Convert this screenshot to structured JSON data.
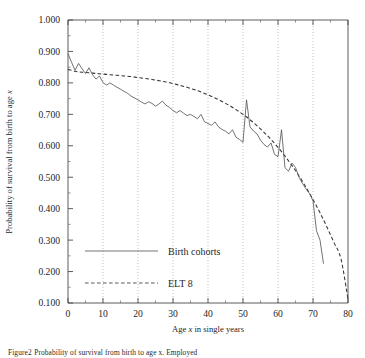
{
  "figure": {
    "caption_prefix": "Figure",
    "caption_number": "2",
    "caption_text": "Probability of survival from birth to age x. Employed"
  },
  "chart_data": {
    "type": "line",
    "title": "",
    "xlabel": "Age x in single years",
    "ylabel": "Probability of survival from birth to age x",
    "xlim": [
      0,
      80
    ],
    "ylim": [
      0.1,
      1.0
    ],
    "xticks": [
      0,
      10,
      20,
      30,
      40,
      50,
      60,
      70,
      80
    ],
    "xtick_labels": [
      "0",
      "10",
      "20",
      "30",
      "40",
      "50",
      "60",
      "70",
      "80"
    ],
    "yticks": [
      0.1,
      0.2,
      0.3,
      0.4,
      0.5,
      0.6,
      0.7,
      0.8,
      0.9,
      1.0
    ],
    "ytick_labels": [
      "0.100",
      "0.200",
      "0.300",
      "0.400",
      "0.500",
      "0.600",
      "0.700",
      "0.800",
      "0.900",
      "1.000"
    ],
    "grid": "vertical-dotted",
    "gridlines_x": [
      10,
      20,
      30,
      40,
      50,
      60,
      70
    ],
    "legend_position": "lower-left-inside",
    "series": [
      {
        "name": "Birth cohorts",
        "style": "solid",
        "color": "#555555",
        "x": [
          0,
          1,
          2,
          3,
          4,
          5,
          6,
          7,
          8,
          9,
          10,
          11,
          12,
          13,
          14,
          15,
          16,
          17,
          18,
          19,
          20,
          21,
          22,
          23,
          24,
          25,
          26,
          27,
          28,
          29,
          30,
          31,
          32,
          33,
          34,
          35,
          36,
          37,
          38,
          39,
          40,
          41,
          42,
          43,
          44,
          45,
          46,
          47,
          48,
          49,
          50,
          51,
          52,
          53,
          54,
          55,
          56,
          57,
          58,
          59,
          60,
          61,
          62,
          63,
          64,
          65,
          66,
          67,
          68,
          69,
          70,
          71,
          72,
          73
        ],
        "values": [
          0.893,
          0.866,
          0.84,
          0.862,
          0.845,
          0.83,
          0.848,
          0.826,
          0.812,
          0.822,
          0.801,
          0.793,
          0.8,
          0.793,
          0.786,
          0.78,
          0.773,
          0.767,
          0.758,
          0.752,
          0.746,
          0.739,
          0.733,
          0.74,
          0.735,
          0.726,
          0.733,
          0.742,
          0.729,
          0.722,
          0.712,
          0.705,
          0.712,
          0.704,
          0.696,
          0.7,
          0.693,
          0.686,
          0.7,
          0.676,
          0.671,
          0.665,
          0.676,
          0.66,
          0.652,
          0.646,
          0.638,
          0.651,
          0.627,
          0.62,
          0.611,
          0.746,
          0.66,
          0.647,
          0.638,
          0.618,
          0.604,
          0.596,
          0.609,
          0.573,
          0.565,
          0.651,
          0.53,
          0.519,
          0.545,
          0.531,
          0.5,
          0.48,
          0.463,
          0.448,
          0.425,
          0.33,
          0.3,
          0.225
        ]
      },
      {
        "name": "ELT 8",
        "style": "dashed",
        "color": "#333333",
        "x": [
          0,
          2,
          4,
          6,
          8,
          10,
          12,
          14,
          16,
          18,
          20,
          22,
          24,
          26,
          28,
          30,
          32,
          34,
          36,
          38,
          40,
          42,
          44,
          46,
          48,
          50,
          52,
          54,
          56,
          58,
          60,
          62,
          64,
          66,
          68,
          70,
          72,
          74,
          76,
          78,
          80
        ],
        "values": [
          0.843,
          0.837,
          0.834,
          0.832,
          0.83,
          0.828,
          0.826,
          0.824,
          0.822,
          0.82,
          0.817,
          0.814,
          0.811,
          0.807,
          0.803,
          0.798,
          0.792,
          0.786,
          0.779,
          0.771,
          0.762,
          0.752,
          0.741,
          0.729,
          0.715,
          0.7,
          0.683,
          0.664,
          0.643,
          0.62,
          0.595,
          0.567,
          0.537,
          0.504,
          0.468,
          0.429,
          0.387,
          0.341,
          0.292,
          0.24,
          0.112
        ]
      }
    ]
  },
  "legend": {
    "items": [
      {
        "label": "Birth cohorts",
        "style": "solid"
      },
      {
        "label": "ELT 8",
        "style": "dashed"
      }
    ]
  },
  "axis_title_x": {
    "prefix": "Age ",
    "var": "x",
    "suffix": " in single years"
  },
  "axis_title_y": {
    "prefix": "Probability of survival from birth to age ",
    "var": "x"
  }
}
